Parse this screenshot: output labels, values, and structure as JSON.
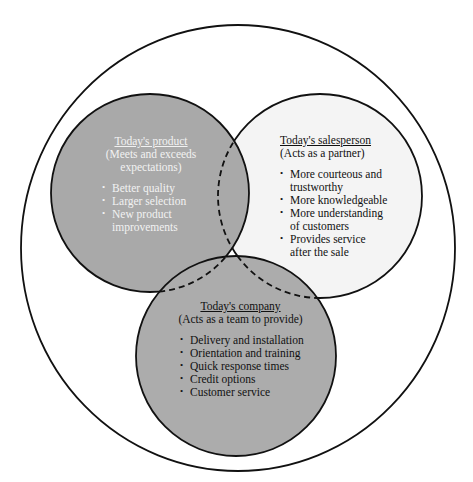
{
  "diagram": {
    "colors": {
      "outer_fill": "#ffffff",
      "product_fill": "#a9a9a9",
      "salesperson_fill": "#f4f4f4",
      "company_fill": "#acacac",
      "stroke": "#111111"
    },
    "product": {
      "title": "Today's product",
      "subtitle": "(Meets and exceeds expectations)",
      "items": [
        "Better quality",
        "Larger selection",
        "New product improvements"
      ]
    },
    "salesperson": {
      "title": "Today's salesperson",
      "subtitle": "(Acts as a partner)",
      "items": [
        "More courteous and trustworthy",
        "More knowledgeable",
        "More understanding of customers",
        "Provides service after the sale"
      ]
    },
    "company": {
      "title": "Today's company",
      "subtitle": "(Acts as a team to provide)",
      "items": [
        "Delivery and installation",
        "Orientation and training",
        "Quick response times",
        "Credit options",
        "Customer service"
      ]
    }
  }
}
